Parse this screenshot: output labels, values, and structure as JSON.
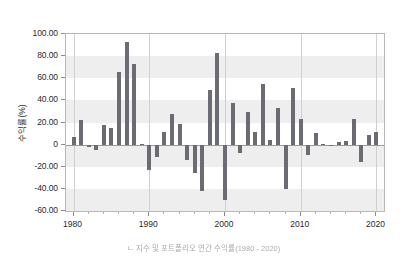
{
  "figure": {
    "background_color": "#ffffff",
    "bar_color": "#6b6b73",
    "band_color": "#eeeeee",
    "grid_color": "#cfcfcf",
    "caption": "ㄴ 지수 및 포트폴리오 연간 수익률(1980 - 2020)"
  },
  "axes": {
    "y_title": "수익률(%)",
    "y_ticks": [
      "100.00",
      "80.00",
      "60.00",
      "40.00",
      "20.00",
      "0",
      "-20.00",
      "-40.00",
      "-60.00"
    ],
    "x_ticks": [
      "1980",
      "1990",
      "2000",
      "2010",
      "2020"
    ]
  },
  "chart_data": {
    "type": "bar",
    "title": "",
    "xlabel": "",
    "ylabel": "수익률(%)",
    "ylim": [
      -60,
      100
    ],
    "xlim": [
      1979,
      2021
    ],
    "grid": true,
    "legend": "none",
    "yticks": [
      100,
      80,
      60,
      40,
      20,
      0,
      -20,
      -40,
      -60
    ],
    "ytick_labels": [
      "100.00",
      "80.00",
      "60.00",
      "40.00",
      "20.00",
      "0",
      "-20.00",
      "-40.00",
      "-60.00"
    ],
    "xticks": [
      1980,
      1990,
      2000,
      2010,
      2020
    ],
    "xtick_labels": [
      "1980",
      "1990",
      "2000",
      "2010",
      "2020"
    ],
    "categories": [
      1980,
      1981,
      1982,
      1983,
      1984,
      1985,
      1986,
      1987,
      1988,
      1989,
      1990,
      1991,
      1992,
      1993,
      1994,
      1995,
      1996,
      1997,
      1998,
      1999,
      2000,
      2001,
      2002,
      2003,
      2004,
      2005,
      2006,
      2007,
      2008,
      2009,
      2010,
      2011,
      2012,
      2013,
      2014,
      2015,
      2016,
      2017,
      2018,
      2019,
      2020
    ],
    "values": [
      6.5,
      22.5,
      -2.0,
      -4.5,
      17.5,
      15.0,
      66.0,
      93.0,
      72.5,
      0.5,
      -22.5,
      -11.5,
      11.5,
      27.5,
      18.5,
      -13.5,
      -26.0,
      -42.0,
      49.5,
      83.0,
      -50.0,
      38.0,
      -7.5,
      29.5,
      11.5,
      55.0,
      4.5,
      33.0,
      -40.5,
      51.0,
      23.0,
      -9.5,
      10.5,
      1.0,
      -1.5,
      2.5,
      3.5,
      23.0,
      -15.5,
      9.0,
      11.0
    ]
  }
}
